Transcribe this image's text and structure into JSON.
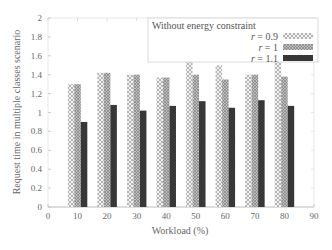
{
  "chart_data": {
    "type": "bar",
    "title": "",
    "xlabel": "Workload (%)",
    "ylabel": "Request time in multiple classes scenario",
    "xlim": [
      0,
      90
    ],
    "ylim": [
      0,
      2
    ],
    "xticks": [
      0,
      10,
      20,
      30,
      40,
      50,
      60,
      70,
      80,
      90
    ],
    "yticks": [
      0,
      0.2,
      0.4,
      0.6,
      0.8,
      1,
      1.2,
      1.4,
      1.6,
      1.8,
      2
    ],
    "ytick_labels": [
      "0",
      "0.2",
      "0.4",
      "0.6",
      "0.8",
      "1",
      "1.2",
      "1.4",
      "1.6",
      "1.8",
      "2"
    ],
    "categories": [
      10,
      20,
      30,
      40,
      50,
      60,
      70,
      80
    ],
    "grid": false,
    "legend_title": "Without energy constraint",
    "legend_position": "top-right",
    "series": [
      {
        "name": "r = 0.9",
        "pattern": "crosshatch-light",
        "values": [
          1.3,
          1.42,
          1.4,
          1.37,
          1.57,
          1.5,
          1.4,
          1.6
        ]
      },
      {
        "name": "r = 1",
        "pattern": "hatch-medium",
        "values": [
          1.3,
          1.42,
          1.4,
          1.37,
          1.4,
          1.35,
          1.4,
          1.38
        ]
      },
      {
        "name": "r = 1.1",
        "pattern": "solid-dark",
        "values": [
          0.9,
          1.08,
          1.02,
          1.07,
          1.12,
          1.05,
          1.13,
          1.07
        ]
      }
    ]
  },
  "legend": {
    "title": "Without energy constraint",
    "items": [
      {
        "var": "r",
        "label": " = 0.9"
      },
      {
        "var": "r",
        "label": " = 1"
      },
      {
        "var": "r",
        "label": " = 1.1"
      }
    ]
  },
  "axes": {
    "xlabel": "Workload (%)",
    "ylabel": "Request time in multiple classes scenario"
  }
}
